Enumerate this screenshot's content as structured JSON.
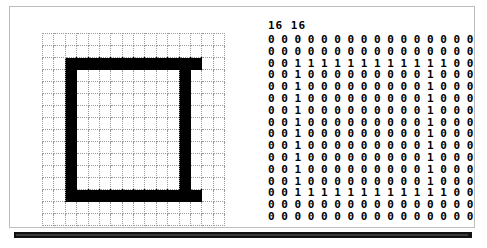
{
  "window": {
    "title": "Bitmap Grid Viewer"
  },
  "matrix": {
    "dims_label": "16 16",
    "width": 16,
    "height": 16,
    "on_color": "#000000",
    "off_color": "#ffffff",
    "grid_line_color": "#9a9a9a",
    "rows": [
      [
        0,
        0,
        0,
        0,
        0,
        0,
        0,
        0,
        0,
        0,
        0,
        0,
        0,
        0,
        0,
        0
      ],
      [
        0,
        0,
        0,
        0,
        0,
        0,
        0,
        0,
        0,
        0,
        0,
        0,
        0,
        0,
        0,
        0
      ],
      [
        0,
        0,
        1,
        1,
        1,
        1,
        1,
        1,
        1,
        1,
        1,
        1,
        1,
        1,
        0,
        0
      ],
      [
        0,
        0,
        1,
        0,
        0,
        0,
        0,
        0,
        0,
        0,
        0,
        0,
        1,
        0,
        0,
        0
      ],
      [
        0,
        0,
        1,
        0,
        0,
        0,
        0,
        0,
        0,
        0,
        0,
        0,
        1,
        0,
        0,
        0
      ],
      [
        0,
        0,
        1,
        0,
        0,
        0,
        0,
        0,
        0,
        0,
        0,
        0,
        1,
        0,
        0,
        0
      ],
      [
        0,
        0,
        1,
        0,
        0,
        0,
        0,
        0,
        0,
        0,
        0,
        0,
        1,
        0,
        0,
        0
      ],
      [
        0,
        0,
        1,
        0,
        0,
        0,
        0,
        0,
        0,
        0,
        0,
        0,
        1,
        0,
        0,
        0
      ],
      [
        0,
        0,
        1,
        0,
        0,
        0,
        0,
        0,
        0,
        0,
        0,
        0,
        1,
        0,
        0,
        0
      ],
      [
        0,
        0,
        1,
        0,
        0,
        0,
        0,
        0,
        0,
        0,
        0,
        0,
        1,
        0,
        0,
        0
      ],
      [
        0,
        0,
        1,
        0,
        0,
        0,
        0,
        0,
        0,
        0,
        0,
        0,
        1,
        0,
        0,
        0
      ],
      [
        0,
        0,
        1,
        0,
        0,
        0,
        0,
        0,
        0,
        0,
        0,
        0,
        1,
        0,
        0,
        0
      ],
      [
        0,
        0,
        1,
        0,
        0,
        0,
        0,
        0,
        0,
        0,
        0,
        0,
        1,
        0,
        0,
        0
      ],
      [
        0,
        0,
        1,
        1,
        1,
        1,
        1,
        1,
        1,
        1,
        1,
        1,
        1,
        1,
        0,
        0
      ],
      [
        0,
        0,
        0,
        0,
        0,
        0,
        0,
        0,
        0,
        0,
        0,
        0,
        0,
        0,
        0,
        0
      ],
      [
        0,
        0,
        0,
        0,
        0,
        0,
        0,
        0,
        0,
        0,
        0,
        0,
        0,
        0,
        0,
        0
      ]
    ]
  }
}
